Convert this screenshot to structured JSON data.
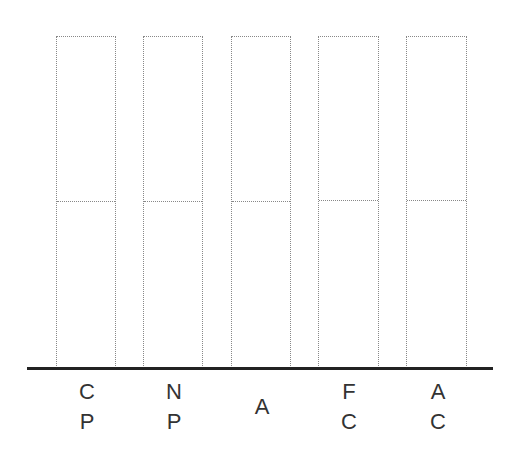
{
  "columns": [
    {
      "id": "cp",
      "lines": [
        "C",
        "P"
      ],
      "left": 56,
      "width": 60
    },
    {
      "id": "np",
      "lines": [
        "N",
        "P"
      ],
      "left": 143,
      "width": 60
    },
    {
      "id": "a",
      "lines": [
        "A"
      ],
      "left": 231,
      "width": 60
    },
    {
      "id": "fc",
      "lines": [
        "F",
        "C"
      ],
      "left": 318,
      "width": 61
    },
    {
      "id": "ac",
      "lines": [
        "A",
        "C"
      ],
      "left": 406,
      "width": 61
    }
  ]
}
